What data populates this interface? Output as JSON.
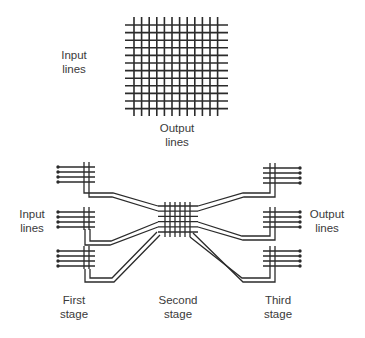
{
  "colors": {
    "line": "#2b2b2b",
    "text": "#3a3a3a",
    "background": "#ffffff"
  },
  "crossbar": {
    "input_label": "Input\nlines",
    "output_label": "Output\nlines",
    "rows": 12,
    "cols": 12
  },
  "multistage": {
    "input_label": "Input\nlines",
    "output_label": "Output\nlines",
    "stage_labels": [
      "First\nstage",
      "Second\nstage",
      "Third\nstage"
    ],
    "first_stage_blocks": 3,
    "third_stage_blocks": 3,
    "lines_per_block": 4,
    "second_stage_grid": 6
  }
}
